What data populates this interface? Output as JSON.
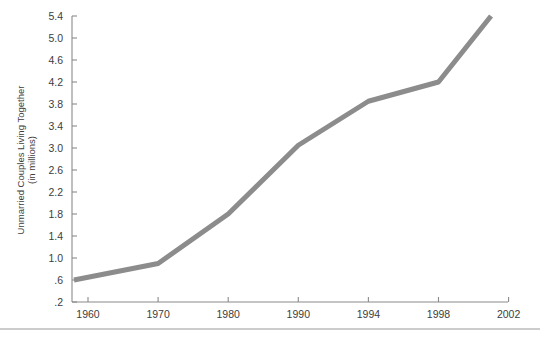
{
  "chart_data": {
    "type": "line",
    "title": "",
    "subtitle": "",
    "xlabel": "",
    "ylabel": "Unmarried Couples Living Together",
    "ylabel_line2": "(in millions)",
    "x": [
      1958,
      1970,
      1980,
      1990,
      1994,
      1998,
      2001
    ],
    "values": [
      0.6,
      0.9,
      1.8,
      3.05,
      3.85,
      4.2,
      5.4
    ],
    "series": [
      {
        "name": "Unmarried Couples Living Together (in millions)",
        "values": [
          0.6,
          0.9,
          1.8,
          3.05,
          3.85,
          4.2,
          5.4
        ]
      }
    ],
    "x_tick_labels": [
      "1960",
      "1970",
      "1980",
      "1990",
      "1994",
      "1998",
      "2002"
    ],
    "x_tick_values": [
      1960,
      1970,
      1980,
      1990,
      1994,
      1998,
      2002
    ],
    "y_tick_labels": [
      ".2",
      ".6",
      "1.0",
      "1.4",
      "1.8",
      "2.2",
      "2.6",
      "3.0",
      "3.4",
      "3.8",
      "4.2",
      "4.6",
      "5.0",
      "5.4"
    ],
    "y_tick_values": [
      0.2,
      0.6,
      1.0,
      1.4,
      1.8,
      2.2,
      2.6,
      3.0,
      3.4,
      3.8,
      4.2,
      4.6,
      5.0,
      5.4
    ],
    "ylim": [
      0.2,
      5.4
    ],
    "grid": false,
    "legend": "none",
    "line_color": "#8c8c8c",
    "axis_color": "#8a8a8a",
    "background_color": "#ffffff"
  }
}
